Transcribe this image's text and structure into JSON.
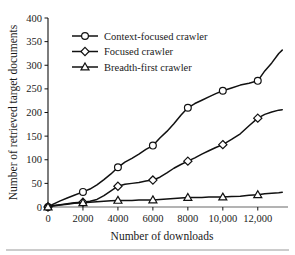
{
  "figure": {
    "name": "crawler-performance-chart",
    "footer_rule": true
  },
  "chart_data": {
    "type": "line",
    "title": "",
    "xlabel": "Number of downloads",
    "ylabel": "Number of retrieved target documents",
    "xlim": [
      0,
      13500
    ],
    "ylim": [
      0,
      400
    ],
    "xticks": [
      0,
      2000,
      4000,
      6000,
      8000,
      10000,
      12000
    ],
    "xtick_labels": [
      "0",
      "2000",
      "4000",
      "6000",
      "8000",
      "10,000",
      "12,000"
    ],
    "yticks": [
      0,
      50,
      100,
      150,
      200,
      250,
      300,
      350,
      400
    ],
    "ytick_labels": [
      "0",
      "50",
      "100",
      "150",
      "200",
      "250",
      "300",
      "350",
      "400"
    ],
    "grid": false,
    "legend_position": "upper-left",
    "series": [
      {
        "name": "Context-focused crawler",
        "marker": "circle",
        "marker_x": [
          0,
          2000,
          4000,
          6000,
          8000,
          10000,
          12000
        ],
        "marker_y": [
          0,
          32,
          84,
          130,
          210,
          246,
          267
        ],
        "x": [
          0,
          300,
          700,
          1100,
          1500,
          2000,
          2400,
          2800,
          3200,
          3600,
          4000,
          4400,
          4800,
          5200,
          5600,
          6000,
          6400,
          6800,
          7200,
          7600,
          8000,
          8400,
          8800,
          9200,
          9600,
          10000,
          10500,
          11000,
          11500,
          12000,
          12400,
          12800,
          13200,
          13400
        ],
        "y": [
          0,
          6,
          13,
          19,
          25,
          32,
          38,
          47,
          58,
          70,
          84,
          95,
          103,
          112,
          122,
          130,
          146,
          160,
          176,
          194,
          210,
          219,
          226,
          233,
          240,
          246,
          252,
          258,
          262,
          267,
          288,
          305,
          325,
          332
        ]
      },
      {
        "name": "Focused crawler",
        "marker": "diamond",
        "marker_x": [
          0,
          2000,
          4000,
          6000,
          8000,
          10000,
          12000
        ],
        "marker_y": [
          0,
          10,
          44,
          57,
          97,
          132,
          188
        ],
        "x": [
          0,
          300,
          700,
          1100,
          1500,
          2000,
          2400,
          2800,
          3200,
          3600,
          4000,
          4400,
          4800,
          5200,
          5600,
          6000,
          6400,
          6800,
          7200,
          7600,
          8000,
          8400,
          8800,
          9200,
          9600,
          10000,
          10500,
          11000,
          11500,
          12000,
          12400,
          12800,
          13200,
          13400
        ],
        "y": [
          0,
          3,
          5,
          7,
          9,
          10,
          12,
          16,
          24,
          34,
          44,
          48,
          50,
          52,
          55,
          57,
          63,
          72,
          82,
          90,
          97,
          104,
          112,
          119,
          126,
          132,
          143,
          155,
          172,
          188,
          196,
          201,
          205,
          206
        ]
      },
      {
        "name": "Breadth-first crawler",
        "marker": "triangle",
        "marker_x": [
          0,
          2000,
          4000,
          6000,
          8000,
          10000,
          12000
        ],
        "marker_y": [
          0,
          9,
          14,
          15,
          20,
          21,
          26
        ],
        "x": [
          0,
          300,
          700,
          1100,
          1500,
          2000,
          2400,
          2800,
          3200,
          3600,
          4000,
          4400,
          4800,
          5200,
          5600,
          6000,
          6400,
          6800,
          7200,
          7600,
          8000,
          8400,
          8800,
          9200,
          9600,
          10000,
          10500,
          11000,
          11500,
          12000,
          12400,
          12800,
          13200,
          13400
        ],
        "y": [
          0,
          2,
          4,
          6,
          8,
          9,
          10,
          11,
          12,
          13,
          14,
          14,
          14,
          15,
          15,
          15,
          16,
          17,
          18,
          19,
          20,
          20,
          20,
          21,
          21,
          21,
          22,
          23,
          25,
          26,
          28,
          29,
          30,
          31
        ]
      }
    ]
  }
}
